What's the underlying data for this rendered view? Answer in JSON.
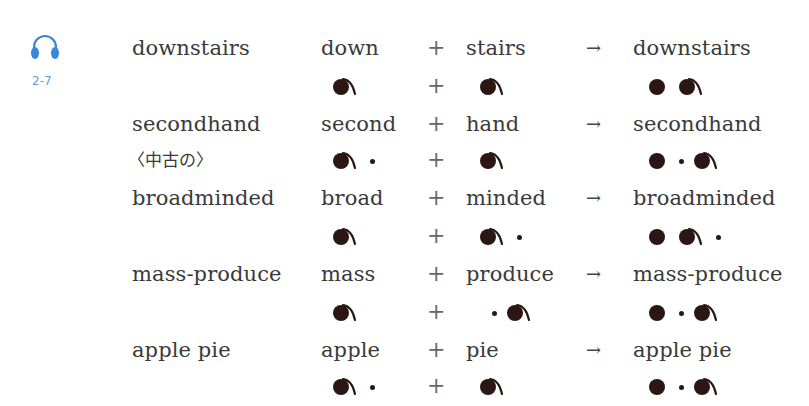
{
  "audio": {
    "icon": "headphones-icon",
    "track": "2-7",
    "color": "#3a86d8"
  },
  "rows": [
    {
      "word": "downstairs",
      "part1": "down",
      "part2": "stairs",
      "result": "downstairs",
      "accents": {
        "part1": "●˜",
        "part2": "●˜",
        "result": "● ●˜"
      }
    },
    {
      "word": "secondhand",
      "gloss": "〈中古の〉",
      "part1": "second",
      "part2": "hand",
      "result": "secondhand",
      "accents": {
        "part1": "●˜ ·",
        "part2": "●˜",
        "result": "● · ●˜"
      }
    },
    {
      "word": "broadminded",
      "part1": "broad",
      "part2": "minded",
      "result": "broadminded",
      "accents": {
        "part1": "●˜",
        "part2": "●˜ ·",
        "result": "● ●˜ ·"
      }
    },
    {
      "word": "mass-produce",
      "part1": "mass",
      "part2": "produce",
      "result": "mass-produce",
      "accents": {
        "part1": "●˜",
        "part2": "· ●˜",
        "result": "● · ●˜"
      }
    },
    {
      "word": "apple pie",
      "part1": "apple",
      "part2": "pie",
      "result": "apple pie",
      "accents": {
        "part1": "●˜ ·",
        "part2": "●˜",
        "result": "● · ●˜"
      }
    }
  ],
  "symbols": {
    "plus": "+",
    "arrow": "→"
  },
  "legend": {
    "big_with_tail": "primary stress",
    "big": "secondary stress",
    "small": "unstressed"
  }
}
